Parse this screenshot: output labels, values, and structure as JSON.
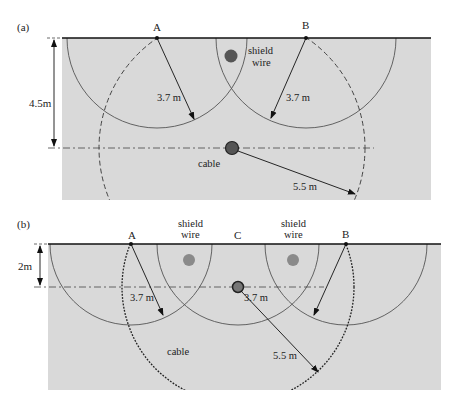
{
  "figure": {
    "panel_a": {
      "label": "(a)",
      "points": {
        "A": "A",
        "B": "B"
      },
      "depth_label": "4.5m",
      "shield_wire_label_line1": "shield",
      "shield_wire_label_line2": "wire",
      "cable_label": "cable",
      "radius_small_A": "3.7 m",
      "radius_small_B": "3.7 m",
      "radius_large": "5.5 m"
    },
    "panel_b": {
      "label": "(b)",
      "points": {
        "A": "A",
        "B": "B",
        "C": "C"
      },
      "depth_label": "2m",
      "shield_wire_left_line1": "shield",
      "shield_wire_left_line2": "wire",
      "shield_wire_right_line1": "shield",
      "shield_wire_right_line2": "wire",
      "cable_label": "cable",
      "radius_small_A": "3.7 m",
      "radius_small_C": "3.7 m",
      "radius_large": "5.5 m"
    },
    "colors": {
      "soil": "#d9d9d9",
      "ground_line": "#111111",
      "circle": "#555555",
      "shield_wire_a": "#555555",
      "shield_wire_b": "#8a8a8a",
      "cable_fill": "#666666"
    }
  }
}
